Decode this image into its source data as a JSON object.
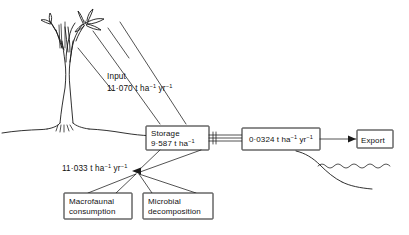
{
  "figure": {
    "background_color": "#ffffff",
    "ink_color": "#1a1a1a"
  },
  "scene": {
    "tree": {
      "name": "sapling-tree",
      "description": "young tree with slender trunk, branches and leaves"
    },
    "ground": {
      "name": "ground-line",
      "description": "soil surface line sloping to shoreline"
    },
    "water": {
      "name": "water-wave-line",
      "description": "wavy line indicating water body at right"
    }
  },
  "annotations": {
    "input": {
      "label": "Input",
      "value": "11·070",
      "unit_base": " t ha",
      "unit_exp1": "−1",
      "unit_mid": " yr",
      "unit_exp2": "−1",
      "full": "11·070 t ha⁻¹ yr⁻¹"
    },
    "loss": {
      "value": "11·033",
      "unit_base": " t ha",
      "unit_exp1": "−1",
      "unit_mid": " yr",
      "unit_exp2": "−1",
      "full": "11·033 t ha⁻¹ yr⁻¹"
    }
  },
  "boxes": {
    "storage": {
      "name": "storage-box",
      "line1": "Storage",
      "line2_value": "9·587",
      "line2_unit": " t ha",
      "line2_exp": "−1",
      "full": "Storage 9·587 t ha⁻¹"
    },
    "export_flux": {
      "name": "export-flux-box",
      "value": "0·0324",
      "unit_base": " t ha",
      "unit_exp1": "−1",
      "unit_mid": " yr",
      "unit_exp2": "−1",
      "full": "0·0324 t ha⁻¹ yr⁻¹"
    },
    "export": {
      "name": "export-box",
      "label": "Export"
    },
    "macrofaunal": {
      "name": "macrofaunal-consumption-box",
      "line1": "Macrofaunal",
      "line2": "consumption"
    },
    "microbial": {
      "name": "microbial-decomposition-box",
      "line1": "Microbial",
      "line2": "decomposition"
    }
  }
}
